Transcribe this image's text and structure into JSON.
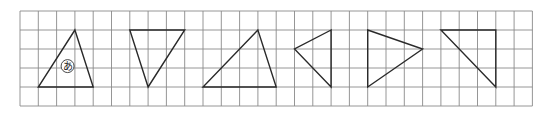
{
  "grid": {
    "origin_x": 20,
    "origin_y": 11,
    "cell_w": 18.3,
    "cell_h": 19,
    "cols": 28,
    "rows": 5,
    "line_color": "#8a8a8a",
    "border_color": "#8a8a8a"
  },
  "shape_style": {
    "stroke": "#2a2a2a",
    "stroke_width": 1.4
  },
  "triangles": [
    {
      "name": "triangle-a",
      "label": "あ",
      "points": [
        [
          3,
          1
        ],
        [
          1,
          4
        ],
        [
          4,
          4
        ]
      ],
      "label_pos": [
        2.6,
        2.9
      ]
    },
    {
      "name": "triangle-2",
      "label": "",
      "points": [
        [
          6,
          1
        ],
        [
          9,
          1
        ],
        [
          7,
          4
        ]
      ]
    },
    {
      "name": "triangle-3",
      "label": "",
      "points": [
        [
          13,
          1
        ],
        [
          10,
          4
        ],
        [
          14,
          4
        ]
      ]
    },
    {
      "name": "triangle-4",
      "label": "",
      "points": [
        [
          17,
          1
        ],
        [
          15,
          2
        ],
        [
          17,
          4
        ]
      ]
    },
    {
      "name": "triangle-5",
      "label": "",
      "points": [
        [
          19,
          1
        ],
        [
          22,
          2
        ],
        [
          19,
          4
        ]
      ]
    },
    {
      "name": "triangle-6",
      "label": "",
      "points": [
        [
          23,
          1
        ],
        [
          26,
          1
        ],
        [
          26,
          4
        ]
      ]
    }
  ]
}
